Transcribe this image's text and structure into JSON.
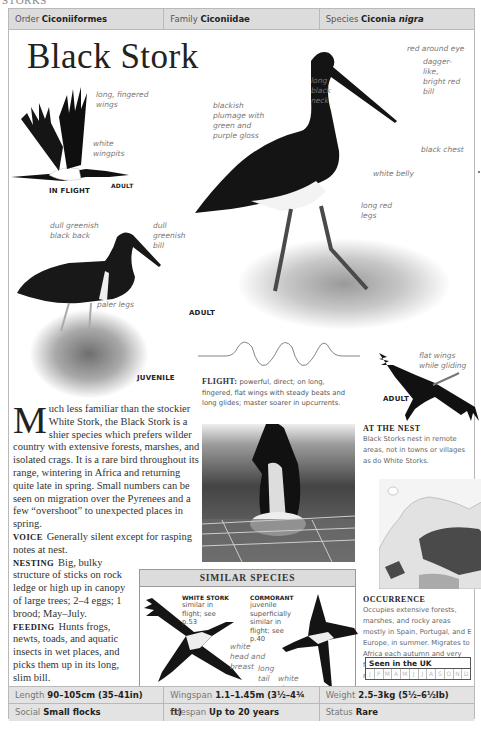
{
  "running_head": "STORKS",
  "taxonomy": {
    "order_label": "Order",
    "order_value": "Ciconiiformes",
    "family_label": "Family",
    "family_value": "Ciconiidae",
    "species_label": "Species",
    "species_value_genus": "Ciconia",
    "species_value_epithet": "nigra"
  },
  "title": "Black Stork",
  "in_flight": {
    "labels": [
      "long, fingered wings",
      "white wingpits"
    ],
    "caption": "IN FLIGHT",
    "age": "ADULT"
  },
  "adult_standing": {
    "labels": {
      "eye": "red around eye",
      "bill": "dagger-like, bright red bill",
      "neck": "long black neck",
      "plumage": "blackish plumage with green and purple gloss",
      "chest": "black chest",
      "belly": "white belly",
      "legs": "long red legs"
    },
    "caption": "ADULT"
  },
  "juvenile": {
    "labels": {
      "back": "dull greenish black back",
      "bill": "dull greenish bill",
      "legs": "paler legs"
    },
    "caption": "JUVENILE"
  },
  "flight_pattern": {
    "heading": "FLIGHT:",
    "text": "powerful, direct; on long, fingered, flat wings with steady beats and long glides; master soarer in upcurrents."
  },
  "gliding": {
    "label": "flat wings while gliding",
    "caption": "ADULT"
  },
  "intro": {
    "dropcap": "M",
    "text": "uch less familiar than the stockier White Stork, the Black Stork is a shier species which prefers wilder country with extensive forests, marshes, and isolated crags. It is a rare bird throughout its range, wintering in Africa and returning quite late in spring. Small numbers can be seen on migration over the Pyrenees and a few “overshoot” to unexpected places in spring."
  },
  "sections": {
    "voice_h": "VOICE",
    "voice": "Generally silent except for rasping notes at nest.",
    "nesting_h": "NESTING",
    "nesting": "Big, bulky structure of sticks on rock ledge or high up in canopy of large trees; 2–4 eggs; 1 brood; May–July.",
    "feeding_h": "FEEDING",
    "feeding": "Hunts frogs, newts, toads, and aquatic insects in wet places, and picks them up in its long, slim bill."
  },
  "at_the_nest": {
    "heading": "AT THE NEST",
    "text": "Black Storks nest in remote areas, not in towns or villages as do White Storks."
  },
  "occurrence": {
    "heading": "OCCURRENCE",
    "text": "Occupies extensive forests, marshes, and rocky areas mostly in Spain, Portugal, and E Europe, in summer. Migrates to Africa each autumn and very few are seen outside regular range."
  },
  "seen_in_uk": {
    "title": "Seen in the UK",
    "months": [
      "J",
      "F",
      "M",
      "A",
      "M",
      "J",
      "J",
      "A",
      "S",
      "O",
      "N",
      "D"
    ]
  },
  "similar_species": {
    "heading": "SIMILAR SPECIES",
    "white_stork": {
      "name": "WHITE STORK",
      "text": "similar in flight; see p.53",
      "label": "white head and breast"
    },
    "cormorant": {
      "name": "CORMORANT",
      "text": "juvenile superficially similar in flight; see p.40",
      "labels": [
        "long tail",
        "white chest"
      ]
    }
  },
  "facts": {
    "length_label": "Length",
    "length": "90–105cm (35–41in)",
    "wingspan_label": "Wingspan",
    "wingspan": "1.1–1.45m (3½–4¾ ft)",
    "weight_label": "Weight",
    "weight": "2.5–3kg (5½–6½lb)",
    "social_label": "Social",
    "social": "Small flocks",
    "lifespan_label": "Lifespan",
    "lifespan": "Up to 20 years",
    "status_label": "Status",
    "status": "Rare"
  }
}
